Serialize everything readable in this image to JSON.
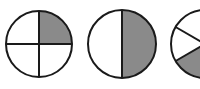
{
  "diagram": {
    "type": "fraction-circles",
    "colors": {
      "shade": "#8a8a8a",
      "stroke": "#1a1a1a",
      "background": "#ffffff"
    },
    "circles": [
      {
        "id": "quarter",
        "parts": 4,
        "shaded": 1,
        "fraction": "1/4",
        "cx": 39,
        "cy": 44,
        "r": 33
      },
      {
        "id": "half",
        "parts": 2,
        "shaded": 1,
        "fraction": "1/2",
        "cx": 122,
        "cy": 44,
        "r": 34
      },
      {
        "id": "third",
        "parts": 3,
        "shaded": 1,
        "fraction": "1/3",
        "cx": 205,
        "cy": 44,
        "r": 34
      }
    ]
  }
}
